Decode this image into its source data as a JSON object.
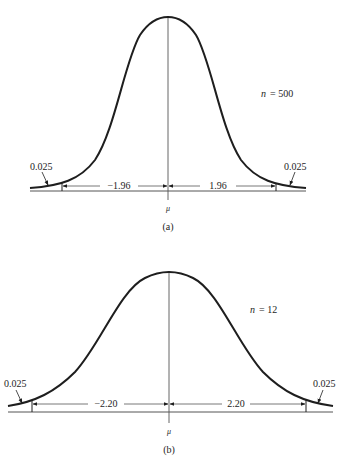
{
  "panels": [
    {
      "id": "a",
      "caption": "(a)",
      "n_label": "n = 500",
      "n_var": "n",
      "n_value": "= 500",
      "left_tail": "0.025",
      "right_tail": "0.025",
      "left_crit": "−1.96",
      "right_crit": "1.96",
      "mean_label": "μ"
    },
    {
      "id": "b",
      "caption": "(b)",
      "n_label": "n = 12",
      "n_var": "n",
      "n_value": "= 12",
      "left_tail": "0.025",
      "right_tail": "0.025",
      "left_crit": "−2.20",
      "right_crit": "2.20",
      "mean_label": "μ"
    }
  ],
  "colors": {
    "ink": "#1e1e1e",
    "thin": "#555555"
  }
}
